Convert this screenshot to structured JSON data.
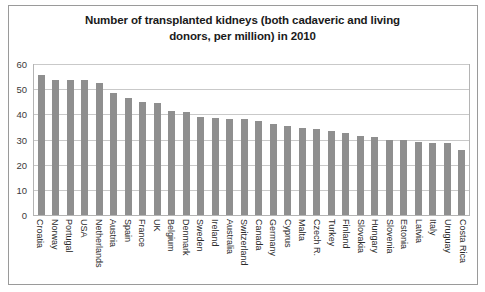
{
  "chart_data": {
    "type": "bar",
    "title": "Number of transplanted kidneys (both cadaveric and living donors, per million) in 2010",
    "title_line1": "Number of transplanted kidneys (both cadaveric and living",
    "title_line2": "donors, per million) in 2010",
    "xlabel": "",
    "ylabel": "",
    "ylim": [
      0,
      60
    ],
    "yticks": [
      60,
      50,
      40,
      30,
      20,
      10,
      0
    ],
    "grid": true,
    "legend": "none",
    "bar_color": "#8f8f8f",
    "categories": [
      "Croatia",
      "Norway",
      "Portugal",
      "USA",
      "Netherlands",
      "Austria",
      "Spain",
      "France",
      "UK",
      "Belgium",
      "Denmark",
      "Sweden",
      "Ireland",
      "Australia",
      "Switzerland",
      "Canada",
      "Germany",
      "Cyprus",
      "Malta",
      "Czech R.",
      "Turkey",
      "Finland",
      "Slovakia",
      "Hungary",
      "Slovenia",
      "Estonia",
      "Latvia",
      "Italy",
      "Uruguay",
      "Costa Rica"
    ],
    "values": [
      55.5,
      53.5,
      53.5,
      53.5,
      52.5,
      48.5,
      46.5,
      45,
      44.5,
      41.5,
      41,
      39,
      38.5,
      38,
      38,
      37.5,
      36,
      35.5,
      34.5,
      34,
      33.5,
      32.5,
      31.5,
      31,
      30,
      30,
      29,
      28.5,
      28.5,
      26
    ]
  }
}
